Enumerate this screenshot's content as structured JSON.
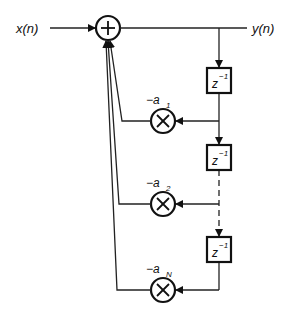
{
  "diagram": {
    "input_label": "x(n)",
    "output_label": "y(n)",
    "summer_symbol": "+",
    "multiplier_symbol": "×",
    "delays": [
      {
        "label_base": "z",
        "label_exp": "−1"
      },
      {
        "label_base": "z",
        "label_exp": "−1"
      },
      {
        "label_base": "z",
        "label_exp": "−1"
      }
    ],
    "coefficients": [
      {
        "prefix": "−a",
        "sub": "1"
      },
      {
        "prefix": "−a",
        "sub": "2"
      },
      {
        "prefix": "−a",
        "sub": "N"
      }
    ],
    "colors": {
      "line": "#222222",
      "background": "#ffffff"
    }
  }
}
